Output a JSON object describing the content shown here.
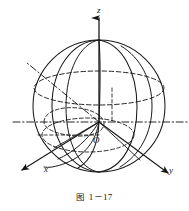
{
  "figure": {
    "caption_cjk": "图",
    "caption_number": "1－17",
    "background_color": "#ffffff",
    "stroke_color": "#1a1a1a",
    "labels": {
      "z_axis": "z",
      "x_axis": "x",
      "y_axis": "y",
      "origin": "O"
    },
    "geometry": {
      "description": "sphere with 3D cartesian axes, great circles, latitude circles and a dash-dot ray through the origin",
      "center": [
        99,
        122
      ],
      "radius": 66,
      "axes": [
        {
          "name": "z-axis",
          "from": [
            99,
            122
          ],
          "to": [
            99,
            14
          ],
          "style": "solid",
          "arrow": true
        },
        {
          "name": "y-axis",
          "from": [
            99,
            122
          ],
          "to": [
            172,
            176
          ],
          "style": "solid",
          "arrow": true
        },
        {
          "name": "x-axis",
          "from": [
            99,
            122
          ],
          "to": [
            20,
            172
          ],
          "style": "solid",
          "arrow": true
        },
        {
          "name": "horizontal-guide",
          "from": [
            14,
            122
          ],
          "to": [
            186,
            122
          ],
          "style": "dash-dot",
          "arrow": false
        },
        {
          "name": "polar-ray",
          "from": [
            99,
            122
          ],
          "to": [
            28,
            64
          ],
          "style": "dash-dot",
          "arrow": false
        }
      ],
      "curves": [
        {
          "name": "sphere-outline",
          "style": "solid"
        },
        {
          "name": "equator-circle",
          "style": "dashed"
        },
        {
          "name": "upper-latitude-circle",
          "style": "dashed"
        },
        {
          "name": "lower-latitude-circle",
          "style": "dashed"
        },
        {
          "name": "meridian-left",
          "style": "solid"
        },
        {
          "name": "meridian-right",
          "style": "solid"
        },
        {
          "name": "meridian-front",
          "style": "solid"
        },
        {
          "name": "cone-arc",
          "style": "dashed"
        },
        {
          "name": "z-axis-dashed-drop",
          "style": "dashed"
        },
        {
          "name": "radius-drop-dashed",
          "style": "dashed"
        }
      ]
    }
  }
}
